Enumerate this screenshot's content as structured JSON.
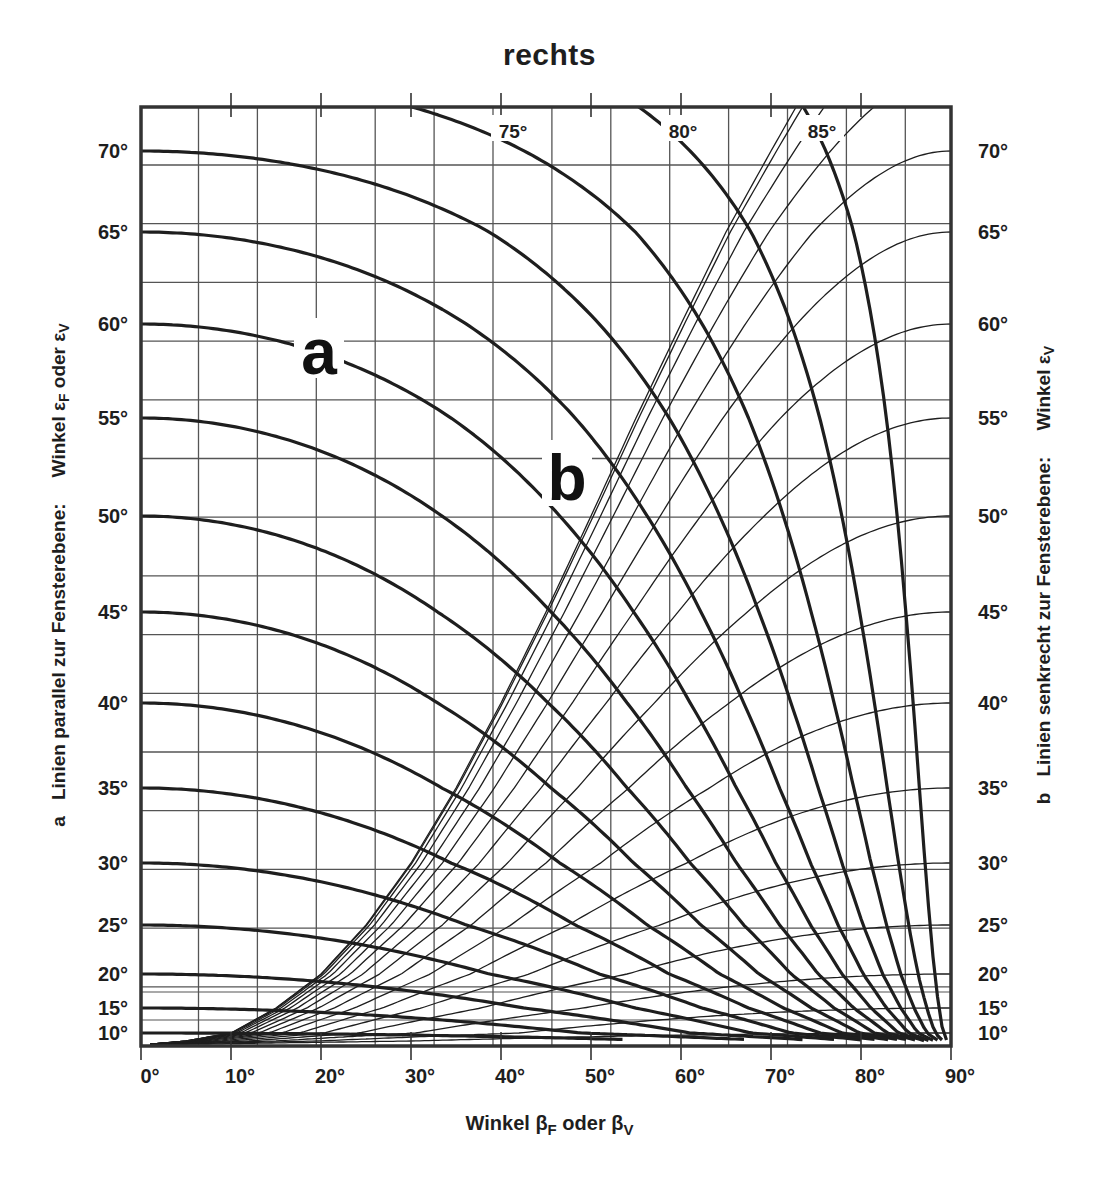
{
  "chart_data": {
    "type": "line",
    "title": "rechts",
    "xlabel": "Winkel βF oder βV",
    "ylabel_left": "a  Linien parallel zur Fensterebene:  Winkel εF oder εV",
    "ylabel_right": "b  Linien senkrecht zur Fensterebene:  Winkel εV",
    "xlim": [
      0,
      90
    ],
    "x_ticks": [
      "0°",
      "10°",
      "20°",
      "30°",
      "40°",
      "50°",
      "60°",
      "70°",
      "80°",
      "90°"
    ],
    "y_ticks": [
      "70°",
      "65°",
      "60°",
      "55°",
      "50°",
      "45°",
      "40°",
      "35°",
      "30°",
      "25°",
      "20°",
      "15°",
      "10°"
    ],
    "ylim": [
      10,
      72
    ],
    "grid": true,
    "series": [
      {
        "name": "a (Linien parallel zur Fensterebene, thick)",
        "family": "a",
        "values_deg": [
          10,
          15,
          20,
          25,
          30,
          35,
          40,
          45,
          50,
          55,
          60,
          65,
          70,
          75,
          80,
          85
        ]
      },
      {
        "name": "b (Linien senkrecht zur Fensterebene, thin)",
        "family": "b",
        "values_deg": [
          10,
          15,
          20,
          25,
          30,
          35,
          40,
          45,
          50,
          55,
          60,
          65,
          70,
          75,
          80,
          85,
          90
        ]
      }
    ],
    "annotations": [
      {
        "text": "a",
        "near_curve": "a 60°"
      },
      {
        "text": "b",
        "near_curve": "a 55°"
      },
      {
        "text": "75°",
        "position": "top"
      },
      {
        "text": "80°",
        "position": "top"
      },
      {
        "text": "85°",
        "position": "top"
      }
    ]
  },
  "labels": {
    "title": "rechts",
    "xlabel_prefix": "Winkel β",
    "xlabel_sub1": "F",
    "xlabel_mid": " oder β",
    "xlabel_sub2": "V",
    "yleft_a": "a",
    "yleft_text": "Linien parallel zur Fensterebene:",
    "yleft_w": "Winkel ε",
    "yleft_sub1": "F",
    "yleft_mid": " oder ε",
    "yleft_sub2": "V",
    "yright_b": "b",
    "yright_text": "Linien senkrecht zur Fensterebene:",
    "yright_w": "Winkel ε",
    "yright_sub": "V",
    "curve_a": "a",
    "curve_b": "b"
  },
  "style": {
    "ink": "#1e1e1e",
    "grid": "#555555",
    "frame": "#333333"
  }
}
